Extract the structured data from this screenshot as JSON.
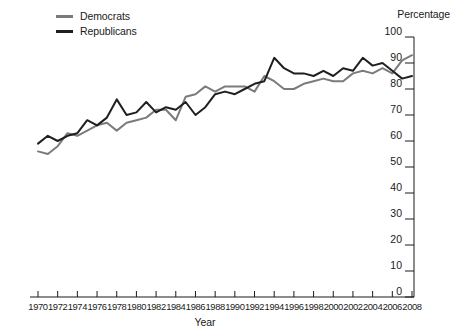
{
  "chart_data": {
    "type": "line",
    "title": "",
    "xlabel": "Year",
    "ylabel": "Percentage",
    "ylim": [
      0,
      100
    ],
    "xlim": [
      1970,
      2008
    ],
    "ytick_step": 10,
    "xtick_step": 2,
    "grid": false,
    "legend_position": "top-left",
    "yticks": [
      0,
      10,
      20,
      30,
      40,
      50,
      60,
      70,
      80,
      90,
      100
    ],
    "x": [
      1970,
      1971,
      1972,
      1973,
      1974,
      1975,
      1976,
      1977,
      1978,
      1979,
      1980,
      1981,
      1982,
      1983,
      1984,
      1985,
      1986,
      1987,
      1988,
      1989,
      1990,
      1991,
      1992,
      1993,
      1994,
      1995,
      1996,
      1997,
      1998,
      1999,
      2000,
      2001,
      2002,
      2003,
      2004,
      2005,
      2006,
      2007,
      2008
    ],
    "xticks": [
      1970,
      1972,
      1974,
      1976,
      1978,
      1980,
      1982,
      1984,
      1986,
      1988,
      1990,
      1992,
      1994,
      1996,
      1998,
      2000,
      2002,
      2004,
      2006,
      2008
    ],
    "series": [
      {
        "name": "Democrats",
        "color": "#7b7b7b",
        "values": [
          56,
          55,
          58,
          63,
          62,
          64,
          66,
          67,
          64,
          67,
          68,
          69,
          72,
          72,
          68,
          77,
          78,
          81,
          79,
          81,
          81,
          81,
          79,
          85,
          83,
          80,
          80,
          82,
          83,
          84,
          83,
          83,
          86,
          87,
          86,
          88,
          86,
          91,
          93
        ]
      },
      {
        "name": "Republicans",
        "color": "#1f1f1f",
        "values": [
          59,
          62,
          60,
          62,
          63,
          68,
          66,
          69,
          76,
          70,
          71,
          75,
          71,
          73,
          72,
          75,
          70,
          73,
          78,
          79,
          78,
          80,
          82,
          83,
          92,
          88,
          86,
          86,
          85,
          87,
          85,
          88,
          87,
          92,
          89,
          90,
          87,
          84,
          85
        ]
      }
    ],
    "annotations": []
  },
  "legend": {
    "items": [
      {
        "label": "Democrats"
      },
      {
        "label": "Republicans"
      }
    ]
  },
  "axes": {
    "y_axis_title": "Percentage",
    "x_axis_title": "Year"
  }
}
